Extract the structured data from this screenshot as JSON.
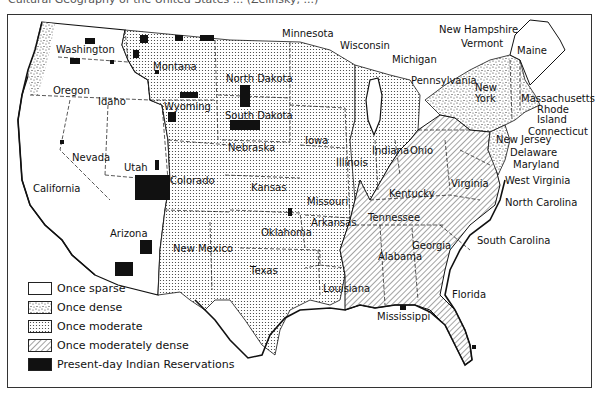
{
  "caption": "Cultural Geography of the United States ... (Zelinsky, ...)",
  "legend": {
    "items": [
      {
        "label": "Once sparse",
        "pattern": "blank"
      },
      {
        "label": "Once dense",
        "pattern": "stipple"
      },
      {
        "label": "Once moderate",
        "pattern": "dots"
      },
      {
        "label": "Once moderately dense",
        "pattern": "hatch"
      },
      {
        "label": "Present-day Indian Reservations",
        "pattern": "solid"
      }
    ]
  },
  "states": {
    "washington": "Washington",
    "oregon": "Oregon",
    "idaho": "Idaho",
    "montana": "Montana",
    "wyoming": "Wyoming",
    "california": "California",
    "nevada": "Nevada",
    "utah": "Utah",
    "colorado": "Colorado",
    "arizona": "Arizona",
    "new_mexico": "New Mexico",
    "north_dakota": "North Dakota",
    "south_dakota": "South Dakota",
    "nebraska": "Nebraska",
    "kansas": "Kansas",
    "oklahoma": "Oklahoma",
    "texas": "Texas",
    "minnesota": "Minnesota",
    "iowa": "Iowa",
    "missouri": "Missouri",
    "arkansas": "Arkansas",
    "louisiana": "Louisiana",
    "wisconsin": "Wisconsin",
    "illinois": "Illinois",
    "michigan": "Michigan",
    "indiana": "Indiana",
    "ohio": "Ohio",
    "kentucky": "Kentucky",
    "tennessee": "Tennessee",
    "mississippi": "Mississippi",
    "alabama": "Alabama",
    "georgia": "Georgia",
    "florida": "Florida",
    "south_carolina": "South Carolina",
    "north_carolina": "North Carolina",
    "virginia": "Virginia",
    "west_virginia": "West Virginia",
    "maryland": "Maryland",
    "delaware": "Delaware",
    "new_jersey": "New Jersey",
    "pennsylvania": "Pennsylvania",
    "new_york_1": "New",
    "new_york_2": "York",
    "connecticut": "Connecticut",
    "rhode_island_1": "Rhode",
    "rhode_island_2": "Island",
    "massachusetts": "Massachusetts",
    "vermont": "Vermont",
    "new_hampshire": "New Hampshire",
    "maine": "Maine"
  },
  "colors": {
    "ink": "#111111",
    "paper": "#ffffff"
  }
}
